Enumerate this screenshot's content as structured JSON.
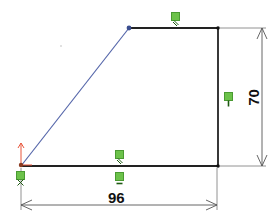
{
  "sketch": {
    "dimensions": {
      "horizontal": {
        "value": "96"
      },
      "vertical": {
        "value": "70"
      }
    },
    "relations": [
      {
        "type": "parallel",
        "icon": "parallel-icon"
      },
      {
        "type": "parallel",
        "icon": "parallel-icon"
      },
      {
        "type": "horizontal",
        "icon": "horizontal-icon"
      },
      {
        "type": "vertical",
        "icon": "vertical-icon"
      },
      {
        "type": "fixed",
        "icon": "fix-icon"
      }
    ],
    "colors": {
      "line": "#222222",
      "selected_line": "#5566aa",
      "relation_fill": "#6cc24a",
      "origin_red": "#e8553a",
      "dimension": "#555555"
    }
  }
}
